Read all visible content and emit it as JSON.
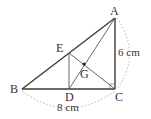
{
  "diagram": {
    "type": "geometry-right-triangle",
    "points": {
      "A": {
        "label": "A",
        "x": 115,
        "y": 18
      },
      "B": {
        "label": "B",
        "x": 22,
        "y": 89
      },
      "C": {
        "label": "C",
        "x": 115,
        "y": 89
      },
      "D": {
        "label": "D",
        "x": 69,
        "y": 89
      },
      "E": {
        "label": "E",
        "x": 69,
        "y": 53
      },
      "G": {
        "label": "G",
        "x": 84,
        "y": 64
      }
    },
    "measurements": {
      "AC": "6 cm",
      "BC": "8 cm"
    },
    "colors": {
      "thick_line": "#3a3a3a",
      "thin_line": "#555555",
      "dotted_arc": "#c8c8c8",
      "text": "#333333"
    }
  }
}
